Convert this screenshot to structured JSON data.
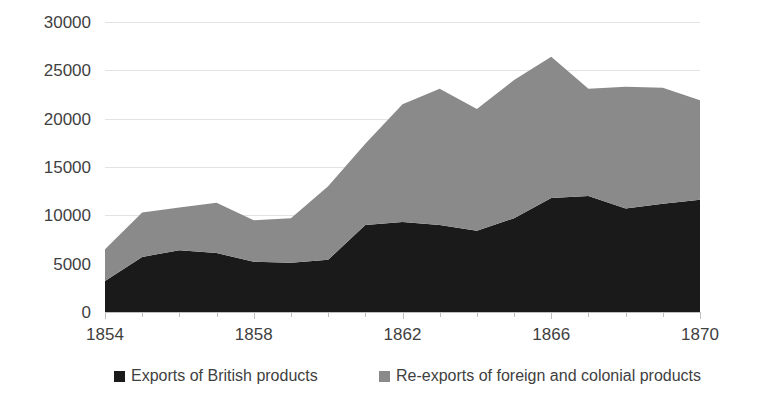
{
  "chart_data": {
    "type": "area",
    "stacked": true,
    "title": "",
    "subtitle": "",
    "xlabel": "",
    "ylabel": "",
    "x": [
      1854,
      1855,
      1856,
      1857,
      1858,
      1859,
      1860,
      1861,
      1862,
      1863,
      1864,
      1865,
      1866,
      1867,
      1868,
      1869,
      1870
    ],
    "categories": [
      "1854",
      "1855",
      "1856",
      "1857",
      "1858",
      "1859",
      "1860",
      "1861",
      "1862",
      "1863",
      "1864",
      "1865",
      "1866",
      "1867",
      "1868",
      "1869",
      "1870"
    ],
    "series": [
      {
        "name": "Exports of British products",
        "color": "#1a1a1a",
        "values": [
          3200,
          5700,
          6400,
          6100,
          5200,
          5100,
          5400,
          9000,
          9300,
          9000,
          8400,
          9700,
          11800,
          12000,
          10700,
          11200,
          11600
        ]
      },
      {
        "name": "Re-exports of foreign and colonial products",
        "color": "#8a8a8a",
        "values": [
          3300,
          4600,
          4400,
          5200,
          4300,
          4600,
          7600,
          8400,
          12200,
          14100,
          12600,
          14300,
          14600,
          11100,
          12600,
          12000,
          10300
        ]
      }
    ],
    "stack_totals": [
      6500,
      10300,
      10800,
      11300,
      9500,
      9700,
      13000,
      17400,
      21500,
      23100,
      21000,
      24000,
      26400,
      23100,
      23300,
      23200,
      21900
    ],
    "ylim": [
      0,
      30000
    ],
    "xlim": [
      1854,
      1870
    ],
    "y_ticks": [
      0,
      5000,
      10000,
      15000,
      20000,
      25000,
      30000
    ],
    "y_tick_labels": [
      "0",
      "5000",
      "10000",
      "15000",
      "20000",
      "25000",
      "30000"
    ],
    "x_ticks": [
      1854,
      1858,
      1862,
      1866,
      1870
    ],
    "x_tick_labels": [
      "1854",
      "1858",
      "1862",
      "1866",
      "1870"
    ],
    "x_minor_ticks": [
      1855,
      1856,
      1857,
      1859,
      1860,
      1861,
      1863,
      1864,
      1865,
      1867,
      1868,
      1869
    ],
    "grid": true,
    "grid_color": "#e3e3e3",
    "legend_position": "bottom",
    "legend": [
      {
        "label": "Exports of British products",
        "color": "#1a1a1a"
      },
      {
        "label": "Re-exports of foreign and colonial products",
        "color": "#8a8a8a"
      }
    ]
  }
}
